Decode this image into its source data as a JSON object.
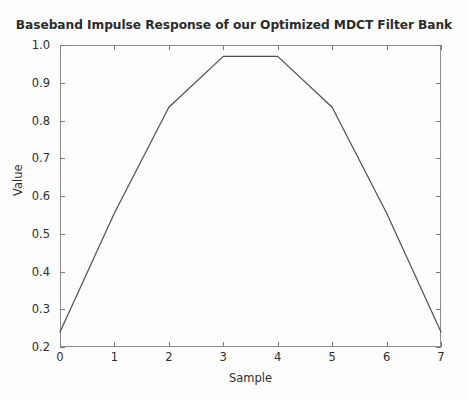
{
  "chart_data": {
    "type": "line",
    "title": "Baseband Impulse Response of our Optimized MDCT Filter Bank",
    "xlabel": "Sample",
    "ylabel": "Value",
    "x": [
      0,
      1,
      2,
      3,
      4,
      5,
      6,
      7
    ],
    "values": [
      0.24,
      0.555,
      0.835,
      0.97,
      0.97,
      0.835,
      0.555,
      0.24
    ],
    "series": [
      {
        "name": "Baseband impulse response",
        "values": [
          0.24,
          0.555,
          0.835,
          0.97,
          0.97,
          0.835,
          0.555,
          0.24
        ]
      }
    ],
    "xlim": [
      0,
      7
    ],
    "ylim": [
      0.2,
      1.0
    ],
    "xticks": [
      0,
      1,
      2,
      3,
      4,
      5,
      6,
      7
    ],
    "xtick_labels": [
      "0",
      "1",
      "2",
      "3",
      "4",
      "5",
      "6",
      "7"
    ],
    "yticks": [
      0.2,
      0.3,
      0.4,
      0.5,
      0.6,
      0.7,
      0.8,
      0.9,
      1.0
    ],
    "ytick_labels": [
      "0.2",
      "0.3",
      "0.4",
      "0.5",
      "0.6",
      "0.7",
      "0.8",
      "0.9",
      "1.0"
    ],
    "grid": false,
    "legend": false,
    "legend_position": "none",
    "line_color": "#4d4d4d",
    "line_width": 1.2,
    "axes_color": "#8c8c8c",
    "background_color": "#fdfdfd",
    "text_color": "#2e2e2e"
  }
}
